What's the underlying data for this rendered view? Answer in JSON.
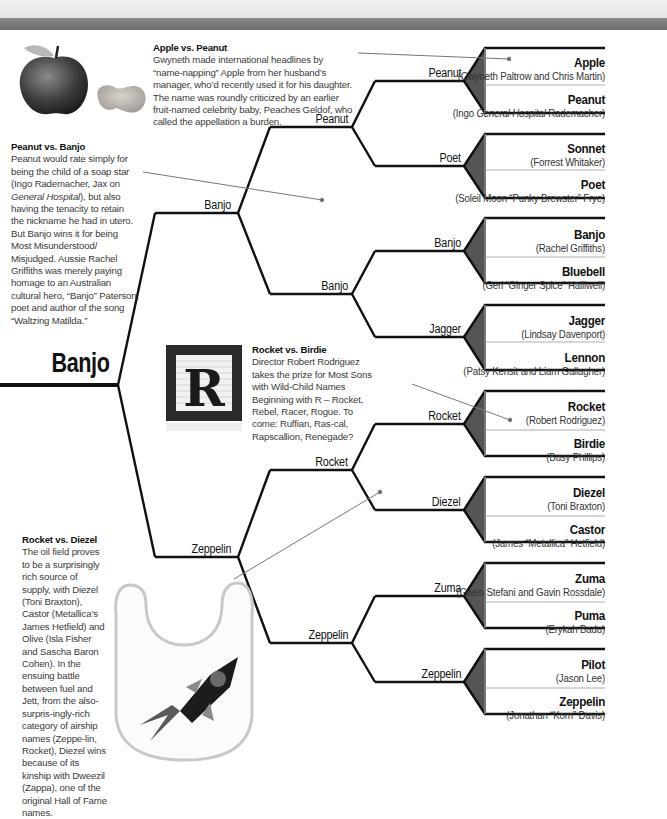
{
  "champion": "Banjo",
  "final": {
    "top": "Banjo",
    "bottom": "Zeppelin"
  },
  "semifinals": [
    "Peanut",
    "Banjo",
    "Rocket",
    "Zeppelin"
  ],
  "quarterfinals": [
    "Peanut",
    "Poet",
    "Banjo",
    "Jagger",
    "Rocket",
    "Diezel",
    "Zuma",
    "Zeppelin"
  ],
  "first_round": [
    {
      "name": "Apple",
      "parents": "(Gwyneth Paltrow and Chris Martin)"
    },
    {
      "name": "Peanut",
      "parents_pre": "(Ingo ",
      "parents_italic": "General Hospital",
      "parents_post": " Rademacher)"
    },
    {
      "name": "Sonnet",
      "parents": "(Forrest Whitaker)"
    },
    {
      "name": "Poet",
      "parents": "(Soleil Moon “Punky Brewster” Frye)"
    },
    {
      "name": "Banjo",
      "parents": "(Rachel Griffiths)"
    },
    {
      "name": "Bluebell",
      "parents": "(Geri “Ginger Spice” Halliwell)"
    },
    {
      "name": "Jagger",
      "parents": "(Lindsay Davenport)"
    },
    {
      "name": "Lennon",
      "parents": "(Patsy Kensit and Liam Gallagher)"
    },
    {
      "name": "Rocket",
      "parents": "(Robert Rodriguez)"
    },
    {
      "name": "Birdie",
      "parents": "(Busy Phillips)"
    },
    {
      "name": "Diezel",
      "parents": "(Toni Braxton)"
    },
    {
      "name": "Castor",
      "parents": "(James “Metallica” Hetfield)"
    },
    {
      "name": "Zuma",
      "parents": "(Gwen Stefani and Gavin Rossdale)"
    },
    {
      "name": "Puma",
      "parents": "(Erykah Badu)"
    },
    {
      "name": "Pilot",
      "parents": "(Jason Lee)"
    },
    {
      "name": "Zeppelin",
      "parents": "(Jonathan “Korn” Davis)"
    }
  ],
  "blurbs": {
    "apple_peanut": {
      "title": "Apple vs. Peanut",
      "text": "Gwyneth made international headlines by “name-napping” Apple from her husband’s manager, who’d recently used it for his daughter. The name was roundly criticized by an earlier fruit-named celebrity baby, Peaches Geldof, who called the appellation a burden."
    },
    "peanut_banjo": {
      "title": "Peanut vs. Banjo",
      "text_1": "Peanut would rate simply for being the child of a soap star (Ingo Rademacher, Jax on ",
      "text_italic_1": "General Hospital",
      "text_2": "), but also having the tenacity to retain the nickname he had in utero. But Banjo wins it for being Most Misunderstood/ Misjudged. Aussie Rachel Griffiths was merely paying homage to an Australian cultural hero, “Banjo” Paterson, poet and author of the song “Waltzing Matilda.”"
    },
    "rocket_birdie": {
      "title": "Rocket vs. Birdie",
      "text": "Director Robert Rodriguez takes the prize for Most Sons with Wild-Child Names Beginning with R – Rocket, Rebel, Racer, Rogue. To come: Ruffian, Ras-cal, Rapscallion, Renegade?"
    },
    "rocket_diezel": {
      "title": "Rocket vs. Diezel",
      "text": "The oil field proves to be a surprisingly rich source of supply, with Diezel (Toni Braxton), Castor (Metallica’s James Hetfield) and Olive (Isla Fisher and Sascha Baron Cohen). In the ensuing battle between fuel and Jett, from the also-surpris-ingly-rich category of airship names (Zeppe-lin, Rocket), Diezel wins because of its kinship with Dweezil (Zappa), one of the original Hall of Fame names."
    }
  },
  "images": {
    "apple": "apple-photo",
    "peanut": "peanut-photo",
    "block": "letter-block-R",
    "bib": "rocket-bib"
  },
  "block_letter": "R",
  "colors": {
    "line": "#111111",
    "wedge": "#555555",
    "header_bar": "#777777",
    "pointer": "#777777"
  }
}
